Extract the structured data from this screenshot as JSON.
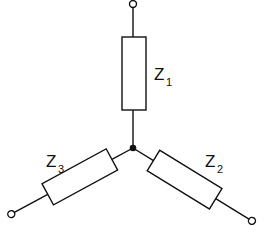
{
  "diagram": {
    "type": "star (Y) impedance network",
    "impedances": [
      {
        "name": "Z",
        "subscript": "1",
        "branch": "top"
      },
      {
        "name": "Z",
        "subscript": "2",
        "branch": "bottom-right"
      },
      {
        "name": "Z",
        "subscript": "3",
        "branch": "bottom-left"
      }
    ],
    "terminals": [
      "top",
      "bottom-left",
      "bottom-right"
    ],
    "center_node": "junction-dot",
    "colors": {
      "stroke": "#111111",
      "background": "#ffffff"
    }
  }
}
